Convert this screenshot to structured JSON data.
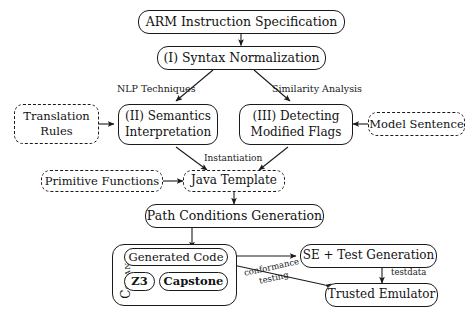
{
  "diagram": {
    "nodes": {
      "arm_spec": {
        "label": "ARM Instruction Specification",
        "style": "solid"
      },
      "syntax_norm": {
        "label": "(I) Syntax Normalization",
        "style": "solid"
      },
      "translation_rules": {
        "line1": "Translation",
        "line2": "Rules",
        "style": "dashed"
      },
      "semantics_interp": {
        "line1": "(II) Semantics",
        "line2": "Interpretation",
        "style": "solid"
      },
      "detecting_flags": {
        "line1": "(III) Detecting",
        "line2": "Modified Flags",
        "style": "solid"
      },
      "model_sentence": {
        "label": "Model Sentence",
        "style": "dashed"
      },
      "primitive_functions": {
        "label": "Primitive Functions",
        "style": "dashed"
      },
      "java_template": {
        "label": "Java Template",
        "style": "dashed"
      },
      "path_conditions": {
        "label": "Path Conditions Generation",
        "style": "solid"
      },
      "generated_code": {
        "label": "Generated Code",
        "style": "solid"
      },
      "z3": {
        "label": "Z3",
        "style": "solid"
      },
      "capstone": {
        "label": "Capstone",
        "style": "solid"
      },
      "se_test_generation": {
        "label": "SE + Test Generation",
        "style": "solid"
      },
      "trusted_emulator": {
        "label": "Trusted Emulator",
        "style": "solid"
      },
      "corana_container": {
        "label": "Corana",
        "style": "solid"
      }
    },
    "edge_labels": {
      "nlp_techniques": "NLP Techniques",
      "similarity_analysis": "Similarity Analysis",
      "instantiation": "Instantiation",
      "testdata": "testdata",
      "conformance_line1": "conformance",
      "conformance_line2": "testing"
    },
    "colors": {
      "stroke": "#1a1a1a",
      "text": "#121212",
      "background": "#ffffff"
    }
  }
}
